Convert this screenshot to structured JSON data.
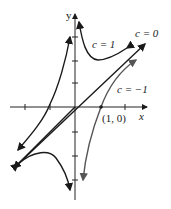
{
  "figure": {
    "axes": {
      "x_label": "x",
      "y_label": "y"
    },
    "point_label": "(1, 0)",
    "curves": [
      {
        "id": "c1",
        "label": "c = 1",
        "color": "#1a1a1a"
      },
      {
        "id": "c0",
        "label": "c = 0",
        "color": "#1a1a1a"
      },
      {
        "id": "cm1",
        "label": "c = −1",
        "color": "#555555"
      }
    ]
  }
}
